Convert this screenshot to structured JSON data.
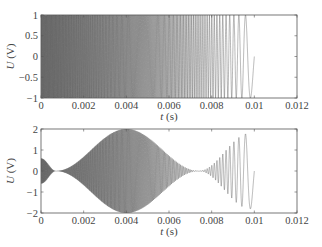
{
  "chart_data": [
    {
      "type": "line",
      "title": "",
      "xlabel": "t (s)",
      "xlabel_italic": "t",
      "xlabel_unit": " (s)",
      "ylabel": "U (V)",
      "ylabel_italic": "U",
      "ylabel_unit": " (V)",
      "xlim": [
        0,
        0.012
      ],
      "ylim": [
        -1,
        1
      ],
      "xticks": [
        0,
        0.002,
        0.004,
        0.006,
        0.008,
        0.01,
        0.012
      ],
      "xtick_labels": [
        "0",
        "0.002",
        "0.004",
        "0.006",
        "0.008",
        "0.01",
        "0.012"
      ],
      "yticks": [
        -1,
        -0.5,
        0,
        0.5,
        1
      ],
      "ytick_labels": [
        "−1",
        "−0.5",
        "0",
        "0.5",
        "1"
      ],
      "grid": false,
      "legend": null,
      "series": [
        {
          "name": "swept-sine (down-chirp)",
          "description": "Constant amplitude 1 V linear chirp, frequency decreasing from very high at t=0 to low near t=0.01 s; signal ends at t=0.01 s",
          "amplitude": 1.0,
          "t_start": 0,
          "t_end": 0.01,
          "f_start_hz": 40000,
          "f_end_hz": 1000,
          "color": "#444444"
        }
      ]
    },
    {
      "type": "line",
      "title": "",
      "xlabel": "t (s)",
      "xlabel_italic": "t",
      "xlabel_unit": " (s)",
      "ylabel": "U (V)",
      "ylabel_italic": "U",
      "ylabel_unit": " (V)",
      "xlim": [
        0,
        0.012
      ],
      "ylim": [
        -2,
        2
      ],
      "xticks": [
        0,
        0.002,
        0.004,
        0.006,
        0.008,
        0.01,
        0.012
      ],
      "xtick_labels": [
        "0",
        "0.002",
        "0.004",
        "0.006",
        "0.008",
        "0.01",
        "0.012"
      ],
      "yticks": [
        -2,
        -1,
        0,
        1,
        2
      ],
      "ytick_labels": [
        "−2",
        "−1",
        "0",
        "1",
        "2"
      ],
      "grid": false,
      "legend": null,
      "series": [
        {
          "name": "beating signal",
          "description": "Chirp with beating envelope: amplitude ~0.6 V at t=0, node near t=0.0007 s, maximum ~2 V near t=0.004 s, node near t=0.0074 s, second lobe ~1.8 V near t=0.0098 s; ends at t=0.01 s",
          "envelope_points": [
            {
              "t": 0.0,
              "amp": 0.6
            },
            {
              "t": 0.0007,
              "amp": 0.0
            },
            {
              "t": 0.004,
              "amp": 2.0
            },
            {
              "t": 0.0074,
              "amp": 0.0
            },
            {
              "t": 0.0098,
              "amp": 1.8
            },
            {
              "t": 0.01,
              "amp": 1.75
            }
          ],
          "t_start": 0,
          "t_end": 0.01,
          "f_start_hz": 40000,
          "f_end_hz": 1000,
          "color": "#444444"
        }
      ]
    }
  ],
  "layout": {
    "panels": [
      {
        "x0": 41,
        "x1": 297,
        "y0": 15,
        "y1": 98
      },
      {
        "x0": 41,
        "x1": 297,
        "y0": 129,
        "y1": 213
      }
    ]
  }
}
